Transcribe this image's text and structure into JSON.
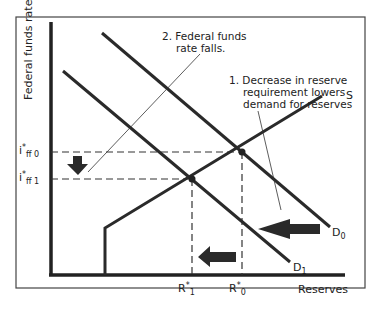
{
  "diagram": {
    "type": "supply-demand (reserves market)",
    "y_axis_label": "Federal funds rate",
    "x_axis_label": "Reserves",
    "curves": {
      "supply": "S",
      "demand_initial": "D",
      "demand_initial_sub": "0",
      "demand_new": "D",
      "demand_new_sub": "1"
    },
    "rates": {
      "initial": {
        "main": "i",
        "sup": "*",
        "sub": "ff 0"
      },
      "new": {
        "main": "i",
        "sup": "*",
        "sub": "ff 1"
      }
    },
    "reserves": {
      "initial": {
        "main": "R",
        "sup": "*",
        "sub": "0"
      },
      "new": {
        "main": "R",
        "sup": "*",
        "sub": "1"
      }
    },
    "annotations": {
      "step1": "1. Decrease in reserve requirement lowers demand for reserves",
      "step1_lines": [
        "1. Decrease in reserve",
        "requirement lowers",
        "demand for reserves"
      ],
      "step2_lines": [
        "2. Federal funds",
        "rate falls."
      ]
    },
    "colors": {
      "line": "#2a2a2a",
      "frame": "#444444",
      "background": "#ffffff"
    }
  }
}
